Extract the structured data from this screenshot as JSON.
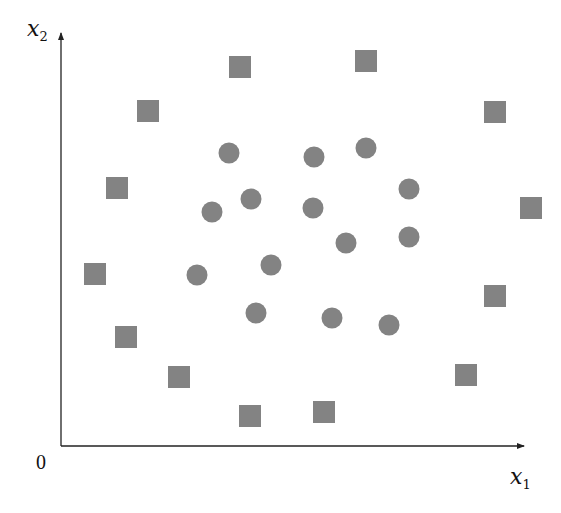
{
  "diagram": {
    "title": "",
    "origin_label": "0",
    "x_axis": {
      "var": "x",
      "sub": "1"
    },
    "y_axis": {
      "var": "x",
      "sub": "2"
    },
    "colors": {
      "marker": "#838383",
      "axis": "#222222"
    },
    "marker_size": 22
  },
  "chart_data": {
    "type": "scatter",
    "title": "",
    "xlabel": "x1",
    "ylabel": "x2",
    "grid": false,
    "legend": null,
    "series": [
      {
        "name": "circles",
        "marker": "circle",
        "points": [
          [
            229,
            153
          ],
          [
            314,
            157
          ],
          [
            366,
            148
          ],
          [
            409,
            189
          ],
          [
            251,
            199
          ],
          [
            212,
            212
          ],
          [
            313,
            208
          ],
          [
            346,
            243
          ],
          [
            409,
            237
          ],
          [
            271,
            265
          ],
          [
            197,
            275
          ],
          [
            256,
            313
          ],
          [
            332,
            318
          ],
          [
            389,
            325
          ]
        ]
      },
      {
        "name": "squares",
        "marker": "square",
        "points": [
          [
            240,
            67
          ],
          [
            366,
            61
          ],
          [
            148,
            111
          ],
          [
            495,
            112
          ],
          [
            117,
            188
          ],
          [
            531,
            208
          ],
          [
            95,
            274
          ],
          [
            495,
            296
          ],
          [
            126,
            337
          ],
          [
            179,
            377
          ],
          [
            466,
            375
          ],
          [
            250,
            416
          ],
          [
            324,
            412
          ]
        ]
      }
    ]
  }
}
